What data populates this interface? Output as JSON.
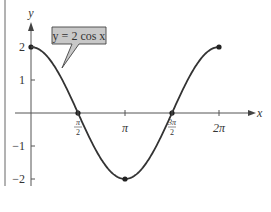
{
  "chart_data": {
    "type": "line",
    "title": "",
    "function_label": "y = 2 cos x",
    "xlabel": "x",
    "ylabel": "y",
    "xlim": [
      0,
      6.2832
    ],
    "ylim": [
      -2,
      2
    ],
    "series": [
      {
        "name": "y = 2 cos x",
        "function": "2*cos(x)",
        "domain": [
          0,
          6.2832
        ]
      }
    ],
    "marked_points": [
      {
        "x": 0,
        "y": 2
      },
      {
        "x": 1.5708,
        "y": 0
      },
      {
        "x": 3.1416,
        "y": -2
      },
      {
        "x": 4.7124,
        "y": 0
      },
      {
        "x": 6.2832,
        "y": 2
      }
    ],
    "x_ticks": [
      {
        "value": 1.5708,
        "label_num": "π",
        "label_den": "2"
      },
      {
        "value": 3.1416,
        "label": "π"
      },
      {
        "value": 4.7124,
        "label_num": "3π",
        "label_den": "2"
      },
      {
        "value": 6.2832,
        "label": "2π"
      }
    ],
    "y_ticks": [
      {
        "value": 2,
        "label": "2"
      },
      {
        "value": 1,
        "label": "1"
      },
      {
        "value": -1,
        "label": "−1"
      },
      {
        "value": -2,
        "label": "−2"
      }
    ],
    "grid": false,
    "legend": "callout top-left",
    "colors": {
      "curve": "#333333",
      "callout_fill": "#c8c8c8",
      "axis": "#555555"
    }
  }
}
